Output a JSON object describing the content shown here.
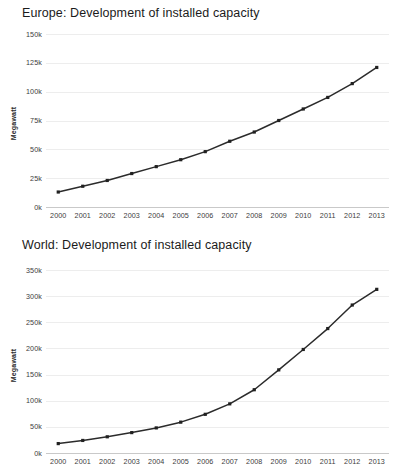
{
  "page": {
    "background_color": "#ffffff",
    "line_color": "#2b2b2b",
    "grid_color": "#ededed",
    "axis_color": "#c9c9c9"
  },
  "charts": [
    {
      "id": "europe",
      "title": "Europe: Development of installed capacity",
      "ylabel": "Megawatt",
      "xlabel": "",
      "type": "line",
      "categories": [
        "2000",
        "2001",
        "2002",
        "2003",
        "2004",
        "2005",
        "2006",
        "2007",
        "2008",
        "2009",
        "2010",
        "2011",
        "2012",
        "2013"
      ],
      "ytick_labels": [
        "0k",
        "25k",
        "50k",
        "75k",
        "100k",
        "125k",
        "150k"
      ],
      "ytick_values": [
        0,
        25000,
        50000,
        75000,
        100000,
        125000,
        150000
      ],
      "ylim": [
        0,
        150000
      ],
      "values": [
        13000,
        18000,
        23000,
        29000,
        35000,
        41000,
        48000,
        57000,
        65000,
        75000,
        85000,
        95000,
        107000,
        121000
      ],
      "grid": true,
      "legend": "none"
    },
    {
      "id": "world",
      "title": "World: Development of installed capacity",
      "ylabel": "Megawatt",
      "xlabel": "",
      "type": "line",
      "categories": [
        "2000",
        "2001",
        "2002",
        "2003",
        "2004",
        "2005",
        "2006",
        "2007",
        "2008",
        "2009",
        "2010",
        "2011",
        "2012",
        "2013"
      ],
      "ytick_labels": [
        "0k",
        "50k",
        "100k",
        "150k",
        "200k",
        "250k",
        "300k",
        "350k"
      ],
      "ytick_values": [
        0,
        50000,
        100000,
        150000,
        200000,
        250000,
        300000,
        350000
      ],
      "ylim": [
        0,
        350000
      ],
      "values": [
        18000,
        24000,
        31000,
        39000,
        48000,
        59000,
        74000,
        94000,
        121000,
        159000,
        198000,
        238000,
        283000,
        313000
      ],
      "grid": true,
      "legend": "none"
    }
  ],
  "chart_data": [
    {
      "type": "line",
      "title": "Europe: Development of installed capacity",
      "xlabel": "",
      "ylabel": "Megawatt",
      "categories": [
        "2000",
        "2001",
        "2002",
        "2003",
        "2004",
        "2005",
        "2006",
        "2007",
        "2008",
        "2009",
        "2010",
        "2011",
        "2012",
        "2013"
      ],
      "values": [
        13000,
        18000,
        23000,
        29000,
        35000,
        41000,
        48000,
        57000,
        65000,
        75000,
        85000,
        95000,
        107000,
        121000
      ],
      "ylim": [
        0,
        150000
      ],
      "ytick_labels": [
        "0k",
        "25k",
        "50k",
        "75k",
        "100k",
        "125k",
        "150k"
      ],
      "grid": true,
      "legend": "none"
    },
    {
      "type": "line",
      "title": "World: Development of installed capacity",
      "xlabel": "",
      "ylabel": "Megawatt",
      "categories": [
        "2000",
        "2001",
        "2002",
        "2003",
        "2004",
        "2005",
        "2006",
        "2007",
        "2008",
        "2009",
        "2010",
        "2011",
        "2012",
        "2013"
      ],
      "values": [
        18000,
        24000,
        31000,
        39000,
        48000,
        59000,
        74000,
        94000,
        121000,
        159000,
        198000,
        238000,
        283000,
        313000
      ],
      "ylim": [
        0,
        350000
      ],
      "ytick_labels": [
        "0k",
        "50k",
        "100k",
        "150k",
        "200k",
        "250k",
        "300k",
        "350k"
      ],
      "grid": true,
      "legend": "none"
    }
  ]
}
